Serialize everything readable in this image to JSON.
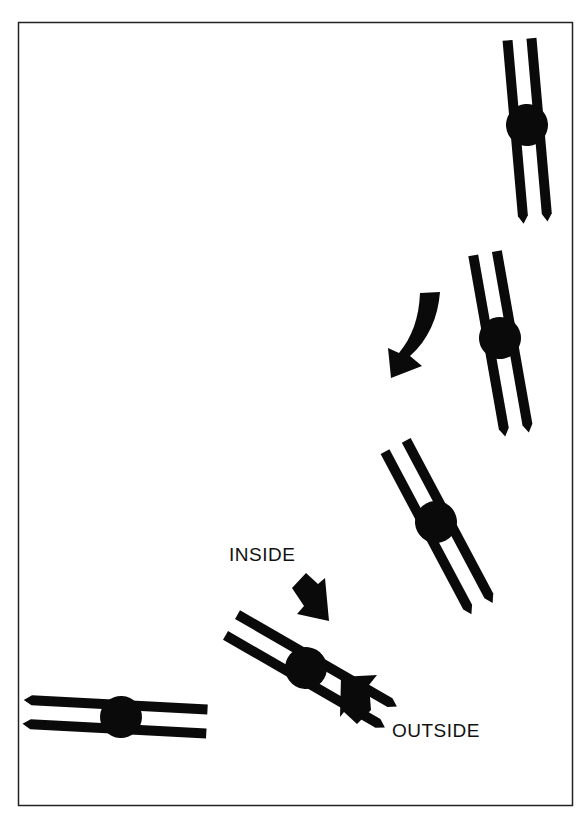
{
  "diagram": {
    "type": "technique-illustration",
    "frame": {
      "x": 18,
      "y": 22,
      "width": 555,
      "height": 784,
      "stroke": "#222222"
    },
    "ink_color": "#0a0a0a",
    "background": "#ffffff",
    "labels": {
      "inside": "INSIDE",
      "outside": "OUTSIDE"
    },
    "blade_pairs": [
      {
        "id": "pair-1",
        "cx": 527,
        "cy": 125,
        "angle": 95
      },
      {
        "id": "pair-2",
        "cx": 500,
        "cy": 338,
        "angle": 102
      },
      {
        "id": "pair-3",
        "cx": 436,
        "cy": 522,
        "angle": 118
      },
      {
        "id": "pair-4",
        "cx": 306,
        "cy": 668,
        "angle": 150
      },
      {
        "id": "pair-5",
        "cx": 121,
        "cy": 717,
        "angle": 183
      }
    ],
    "arrows": [
      {
        "id": "direction-arrow",
        "meaning": "direction of travel (curving down-left)"
      },
      {
        "id": "inside-arrow",
        "meaning": "points toward inside edge"
      },
      {
        "id": "outside-arrow",
        "meaning": "points toward outside edge"
      }
    ]
  }
}
